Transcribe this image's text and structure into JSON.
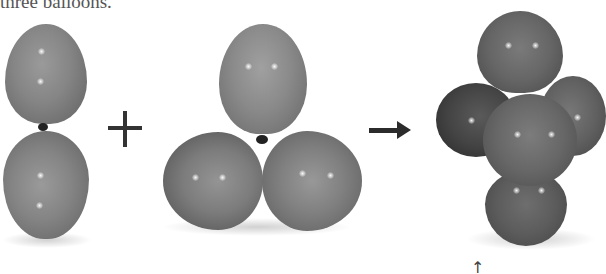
{
  "caption": {
    "text": "three balloons."
  },
  "figure": {
    "operators": {
      "plus": "+",
      "arrow": "→"
    },
    "groups": [
      {
        "name": "two-balloon-pair",
        "balloon_count": 2
      },
      {
        "name": "three-balloon-cluster",
        "balloon_count": 3
      },
      {
        "name": "five-balloon-cluster",
        "balloon_count": 5
      }
    ],
    "pointer_glyph": "↑",
    "colors": {
      "balloon_light": "#8a8a8a",
      "balloon_mid": "#6e6e6e",
      "balloon_dark": "#3a3a3a",
      "operator": "#2b2b2b"
    }
  }
}
